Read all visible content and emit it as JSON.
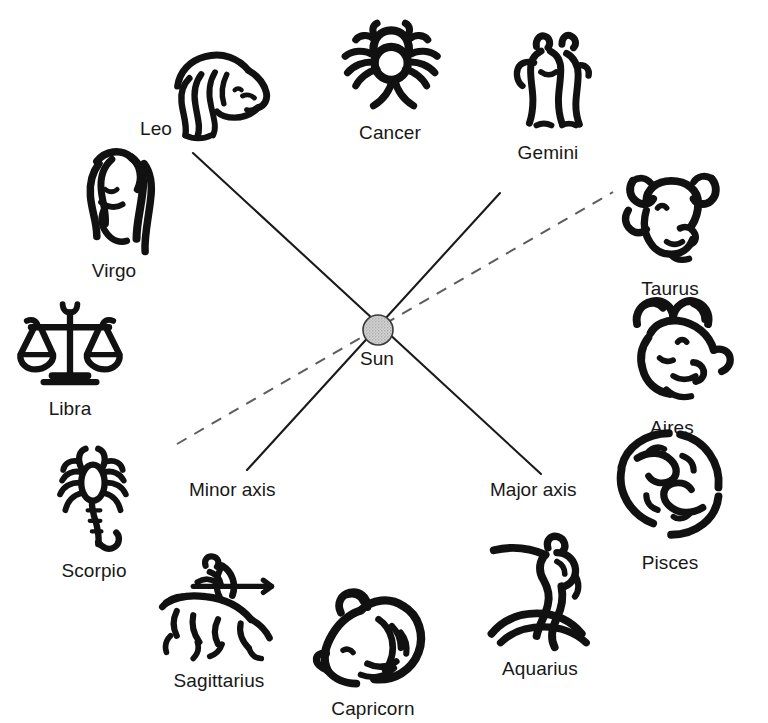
{
  "diagram": {
    "background_color": "#ffffff",
    "line_color": "#1a1a1a",
    "sun": {
      "label": "Sun",
      "fill_color": "#c9c9c9",
      "stroke_color": "#333333",
      "center_x": 378,
      "center_y": 330,
      "radius": 15
    },
    "axes": [
      {
        "name": "major-axis",
        "label": "Major axis",
        "style": "solid",
        "x1": 193,
        "y1": 153,
        "x2": 541,
        "y2": 474,
        "label_x": 490,
        "label_y": 479
      },
      {
        "name": "minor-axis",
        "label": "Minor axis",
        "style": "solid",
        "x1": 500,
        "y1": 193,
        "x2": 247,
        "y2": 470,
        "label_x": 189,
        "label_y": 479
      },
      {
        "name": "ecliptic-dashed-axis",
        "label": "",
        "style": "dashed",
        "x1": 177,
        "y1": 444,
        "x2": 613,
        "y2": 192,
        "label_x": 0,
        "label_y": 0
      }
    ],
    "signs": [
      {
        "name": "cancer",
        "label": "Cancer",
        "icon": "crab-icon",
        "x": 330,
        "y": 2,
        "w": 120,
        "h": 118,
        "label_align": "center"
      },
      {
        "name": "gemini",
        "label": "Gemini",
        "icon": "twins-icon",
        "x": 490,
        "y": 18,
        "w": 116,
        "h": 122,
        "label_align": "center"
      },
      {
        "name": "leo",
        "label": "Leo",
        "icon": "lion-icon",
        "x": 150,
        "y": 44,
        "w": 128,
        "h": 100,
        "label_align": "left"
      },
      {
        "name": "taurus",
        "label": "Taurus",
        "icon": "bull-icon",
        "x": 608,
        "y": 158,
        "w": 124,
        "h": 118,
        "label_align": "center"
      },
      {
        "name": "virgo",
        "label": "Virgo",
        "icon": "maiden-icon",
        "x": 60,
        "y": 140,
        "w": 108,
        "h": 118,
        "label_align": "center"
      },
      {
        "name": "aires",
        "label": "Aires",
        "icon": "ram-icon",
        "x": 610,
        "y": 285,
        "w": 124,
        "h": 130,
        "label_align": "center"
      },
      {
        "name": "libra",
        "label": "Libra",
        "icon": "scales-icon",
        "x": 12,
        "y": 288,
        "w": 116,
        "h": 108,
        "label_align": "center"
      },
      {
        "name": "pisces",
        "label": "Pisces",
        "icon": "fishes-icon",
        "x": 608,
        "y": 418,
        "w": 124,
        "h": 132,
        "label_align": "center"
      },
      {
        "name": "scorpio",
        "label": "Scorpio",
        "icon": "scorpion-icon",
        "x": 38,
        "y": 436,
        "w": 112,
        "h": 122,
        "label_align": "center"
      },
      {
        "name": "aquarius",
        "label": "Aquarius",
        "icon": "water-bearer-icon",
        "x": 478,
        "y": 528,
        "w": 124,
        "h": 128,
        "label_align": "center"
      },
      {
        "name": "sagittarius",
        "label": "Sagittarius",
        "icon": "archer-icon",
        "x": 152,
        "y": 548,
        "w": 134,
        "h": 120,
        "label_align": "center"
      },
      {
        "name": "capricorn",
        "label": "Capricorn",
        "icon": "goat-icon",
        "x": 312,
        "y": 578,
        "w": 122,
        "h": 118,
        "label_align": "center"
      }
    ]
  }
}
